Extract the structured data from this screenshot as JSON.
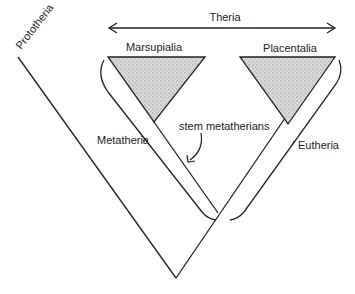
{
  "diagram": {
    "labels": {
      "prototheria": "Prototheria",
      "theria": "Theria",
      "marsupialia": "Marsupialia",
      "placentalia": "Placentalia",
      "metatheria": "Metatheria",
      "eutheria": "Eutheria",
      "stem_metatherians": "stem metatherians"
    },
    "colors": {
      "line": "#222222",
      "fill": "#cfcfcf"
    }
  }
}
